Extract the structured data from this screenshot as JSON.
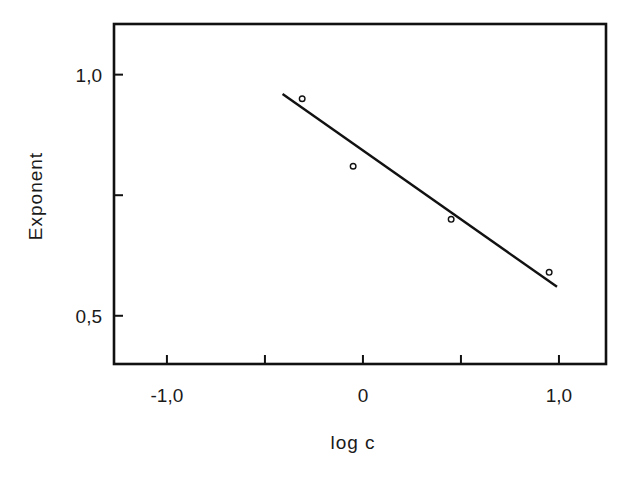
{
  "chart_data": {
    "type": "scatter",
    "title": "",
    "xlabel": "log c",
    "ylabel": "Exponent",
    "xlim": [
      -1.27,
      1.24
    ],
    "ylim": [
      0.4,
      1.105
    ],
    "grid": false,
    "legend": null,
    "x_ticks": [
      {
        "value": -1.0,
        "label": "-1,0"
      },
      {
        "value": -0.5,
        "label": ""
      },
      {
        "value": 0.0,
        "label": "0"
      },
      {
        "value": 0.5,
        "label": ""
      },
      {
        "value": 1.0,
        "label": "1,0"
      }
    ],
    "y_ticks": [
      {
        "value": 1.0,
        "label": "1,0"
      },
      {
        "value": 0.75,
        "label": ""
      },
      {
        "value": 0.5,
        "label": "0,5"
      }
    ],
    "series": [
      {
        "name": "measured",
        "kind": "scatter",
        "marker": "open-circle",
        "x": [
          -0.31,
          -0.05,
          0.45,
          0.95
        ],
        "y": [
          0.95,
          0.81,
          0.7,
          0.59
        ]
      },
      {
        "name": "fit",
        "kind": "line",
        "x": [
          -0.41,
          0.99
        ],
        "y": [
          0.96,
          0.56
        ]
      }
    ]
  },
  "labels": {
    "xlabel": "log c",
    "ylabel": "Exponent"
  },
  "colors": {
    "ink": "#111111",
    "background": "#ffffff"
  }
}
